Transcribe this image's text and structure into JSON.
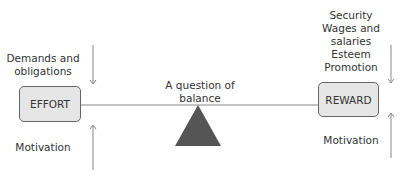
{
  "diagram": {
    "title": "A question of balance",
    "left": {
      "box_label": "EFFORT",
      "top_label": [
        "Demands and",
        "obligations"
      ],
      "bottom_label": "Motivation"
    },
    "right": {
      "box_label": "REWARD",
      "top_label": [
        "Security",
        "Wages and",
        "salaries",
        "Esteem",
        "Promotion"
      ],
      "bottom_label": "Motivation"
    },
    "colors": {
      "box_fill": "#e6e6e6",
      "line": "#777777",
      "fulcrum": "#555555"
    }
  }
}
